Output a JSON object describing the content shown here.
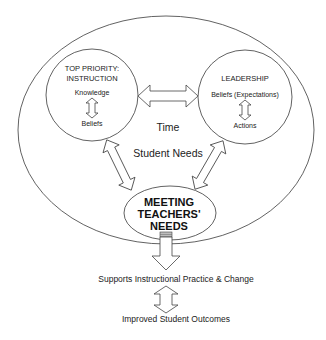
{
  "diagram": {
    "outer_ellipse": {
      "labels": {
        "time": "Time",
        "student_needs": "Student Needs"
      }
    },
    "left_circle": {
      "title_line1": "TOP PRIORITY:",
      "title_line2": "INSTRUCTION",
      "top_item": "Knowledge",
      "bottom_item": "Beliefs"
    },
    "right_circle": {
      "title": "LEADERSHIP",
      "top_item": "Beliefs (Expectations)",
      "bottom_item": "Actions"
    },
    "center_ellipse": {
      "line1": "MEETING",
      "line2": "TEACHERS'",
      "line3": "NEEDS"
    },
    "outcomes": {
      "first": "Supports Instructional Practice & Change",
      "second": "Improved Student Outcomes"
    },
    "connections": [
      {
        "from": "left_circle",
        "to": "right_circle",
        "type": "double-arrow"
      },
      {
        "from": "left_circle",
        "to": "center_ellipse",
        "type": "double-arrow"
      },
      {
        "from": "right_circle",
        "to": "center_ellipse",
        "type": "double-arrow"
      },
      {
        "from": "center_ellipse",
        "to": "outcomes.first",
        "type": "down-arrow"
      },
      {
        "from": "outcomes.first",
        "to": "outcomes.second",
        "type": "double-arrow"
      }
    ],
    "colors": {
      "stroke": "#3a3a3a",
      "text": "#222222",
      "background": "#ffffff"
    }
  }
}
